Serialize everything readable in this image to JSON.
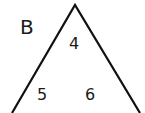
{
  "diagram": {
    "label": "B",
    "numbers": [
      "4",
      "5",
      "6"
    ],
    "stroke_color": "#111111"
  }
}
